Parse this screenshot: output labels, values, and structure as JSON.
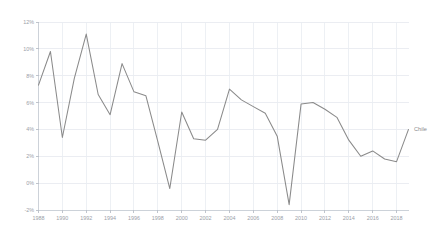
{
  "chart_data": {
    "type": "line",
    "title": "",
    "subtitle": "",
    "xlabel": "",
    "ylabel": "",
    "grid": true,
    "legend_position": "right-inline",
    "line_color": "#8a8a8a",
    "grid_color": "#e6e9ef",
    "axis_color": "#c9ced6",
    "tick_label_color": "#9aa0a8",
    "xlim": [
      1988,
      2019
    ],
    "ylim": [
      -2,
      12
    ],
    "y_tick_labels": [
      "12%",
      "10%",
      "8%",
      "6%",
      "4%",
      "2%",
      "0%",
      "-2%"
    ],
    "y_ticks": [
      12,
      10,
      8,
      6,
      4,
      2,
      0,
      -2
    ],
    "x_tick_labels": [
      "1988",
      "1990",
      "1992",
      "1994",
      "1996",
      "1998",
      "2000",
      "2002",
      "2004",
      "2006",
      "2008",
      "2010",
      "2012",
      "2014",
      "2016",
      "2018"
    ],
    "x_ticks": [
      1988,
      1990,
      1992,
      1994,
      1996,
      1998,
      2000,
      2002,
      2004,
      2006,
      2008,
      2010,
      2012,
      2014,
      2016,
      2018
    ],
    "series": [
      {
        "name": "Chile",
        "x": [
          1988,
          1989,
          1990,
          1991,
          1992,
          1993,
          1994,
          1995,
          1996,
          1997,
          1998,
          1999,
          2000,
          2001,
          2002,
          2003,
          2004,
          2005,
          2006,
          2007,
          2008,
          2009,
          2010,
          2011,
          2012,
          2013,
          2014,
          2015,
          2016,
          2017,
          2018,
          2019
        ],
        "values": [
          7.3,
          9.8,
          3.4,
          7.8,
          11.1,
          6.6,
          5.1,
          8.9,
          6.8,
          6.5,
          3.1,
          -0.4,
          5.3,
          3.3,
          3.2,
          4.0,
          7.0,
          6.2,
          5.7,
          5.2,
          3.5,
          -1.6,
          5.9,
          6.0,
          5.5,
          4.9,
          3.2,
          2.0,
          2.4,
          1.8,
          1.6,
          4.0
        ]
      }
    ],
    "annotations": [
      {
        "text": "Chile",
        "x": 2019,
        "y": 4.0
      }
    ]
  }
}
